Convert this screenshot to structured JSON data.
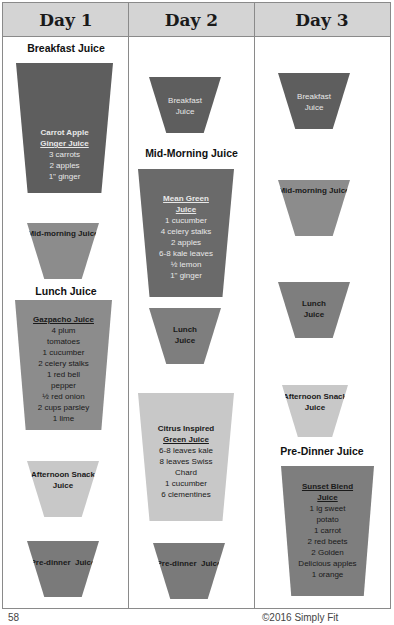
{
  "columns": [
    {
      "header": "Day 1"
    },
    {
      "header": "Day 2"
    },
    {
      "header": "Day 3"
    }
  ],
  "day1": {
    "labels": {
      "breakfast": "Breakfast Juice",
      "lunch": "Lunch Juice"
    },
    "breakfast_cup": {
      "title_line1": "Carrot Apple",
      "title_line2": "Ginger Juice",
      "ingredients": [
        "3 carrots",
        "2 apples",
        "1\" ginger"
      ]
    },
    "midmorning_cup": {
      "name": "Mid-morning Juice"
    },
    "lunch_cup": {
      "title": "Gazpacho Juice",
      "ingredients": [
        "4 plum",
        "tomatoes",
        "1 cucumber",
        "2 celery stalks",
        "1 red bell",
        "pepper",
        "½ red onion",
        "2 cups parsley",
        "1 lime"
      ]
    },
    "afternoon_cup": {
      "name_line1": "Afternoon Snack",
      "name_line2": "Juice"
    },
    "predinner_cup": {
      "name": "Pre-dinner  Juice"
    }
  },
  "day2": {
    "labels": {
      "midmorning": "Mid-Morning Juice"
    },
    "breakfast_cup": {
      "name_line1": "Breakfast",
      "name_line2": "Juice"
    },
    "midmorning_cup": {
      "title_line1": "Mean Green",
      "title_line2": "Juice",
      "ingredients": [
        "1 cucumber",
        "4 celery stalks",
        "2 apples",
        "6-8 kale leaves",
        "½ lemon",
        "1\" ginger"
      ]
    },
    "lunch_cup": {
      "name_line1": "Lunch",
      "name_line2": "Juice"
    },
    "afternoon_cup": {
      "name_line1": "Citrus Inspired",
      "title_line2": "Green Juice",
      "ingredients": [
        "6-8 leaves kale",
        "8 leaves Swiss",
        "Chard",
        "1 cucumber",
        "6 clementines"
      ]
    },
    "predinner_cup": {
      "name": "Pre-dinner  Juice"
    }
  },
  "day3": {
    "labels": {
      "predinner": "Pre-Dinner Juice"
    },
    "breakfast_cup": {
      "name_line1": "Breakfast",
      "name_line2": "Juice"
    },
    "midmorning_cup": {
      "name": "Mid-morning Juice"
    },
    "lunch_cup": {
      "name_line1": "Lunch",
      "name_line2": "Juice"
    },
    "afternoon_cup": {
      "name_line1": "Afternoon Snack",
      "name_line2": "Juice"
    },
    "predinner_cup": {
      "title_line1": "Sunset Blend",
      "title_line2": "Juice",
      "ingredients": [
        "1 lg sweet",
        "potato",
        "1 carrot",
        "2 red beets",
        "2 Golden",
        "Delicious apples",
        "1 orange"
      ]
    }
  },
  "footer": {
    "page_number": "58",
    "right_text": "©2016 Simply Fit"
  },
  "colors": {
    "dark": "#5e5e5e",
    "mid": "#8c8c8c",
    "light": "#c8c8c8",
    "header_bg": "#d4d4d4"
  }
}
